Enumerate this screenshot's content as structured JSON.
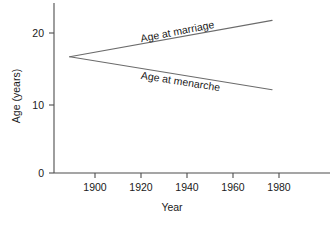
{
  "chart_data": {
    "type": "line",
    "title": "",
    "subtitle": "",
    "xlabel": "Year",
    "ylabel": "Age (years)",
    "xlim": [
      1880,
      2000
    ],
    "ylim": [
      0,
      23
    ],
    "xticks": [
      1900,
      1920,
      1940,
      1960,
      1980
    ],
    "xtick_labels": [
      "1900",
      "1920",
      "1940",
      "1960",
      "1980"
    ],
    "yticks": [
      0,
      10,
      20
    ],
    "ytick_labels": [
      "0",
      "10",
      "20"
    ],
    "grid": false,
    "legend": "inline-annotations",
    "series": [
      {
        "name": "Age at marriage",
        "label": "Age at marriage",
        "x": [
          1889,
          1977
        ],
        "values": [
          16.6,
          21.8
        ],
        "color": "#6b6b6b"
      },
      {
        "name": "Age at menarche",
        "label": "Age at menarche",
        "x": [
          1889,
          1977
        ],
        "values": [
          16.6,
          11.9
        ],
        "color": "#6b6b6b"
      }
    ],
    "annotations": [
      {
        "text": "Age at marriage",
        "x": 1930,
        "y": 20.6
      },
      {
        "text": "Age at menarche",
        "x": 1932,
        "y": 13.6
      }
    ]
  },
  "axes": {
    "y_axis_name": "y-axis",
    "x_axis_name": "x-axis"
  }
}
